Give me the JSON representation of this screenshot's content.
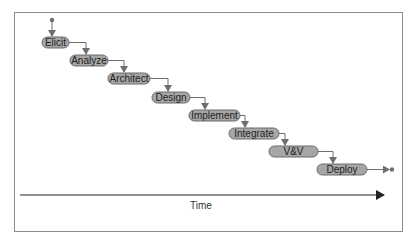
{
  "diagram": {
    "type": "waterfall",
    "stages": [
      {
        "label": "Elicit",
        "x": 42,
        "y": 37,
        "w": 27
      },
      {
        "label": "Analyze",
        "x": 70,
        "y": 55,
        "w": 38
      },
      {
        "label": "Architect",
        "x": 108,
        "y": 73,
        "w": 42
      },
      {
        "label": "Design",
        "x": 152,
        "y": 92,
        "w": 38
      },
      {
        "label": "Implement",
        "x": 189,
        "y": 110,
        "w": 51
      },
      {
        "label": "Integrate",
        "x": 229,
        "y": 128,
        "w": 50
      },
      {
        "label": "V&V",
        "x": 269,
        "y": 146,
        "w": 49
      },
      {
        "label": "Deploy",
        "x": 317,
        "y": 164,
        "w": 50
      }
    ],
    "axis": {
      "label": "Time"
    },
    "colors": {
      "node_fill": "#a6a6a6",
      "node_stroke": "#6a6a6a",
      "connector": "#6f6f6f",
      "axis": "#222222",
      "frame": "#8c8c8c"
    }
  }
}
